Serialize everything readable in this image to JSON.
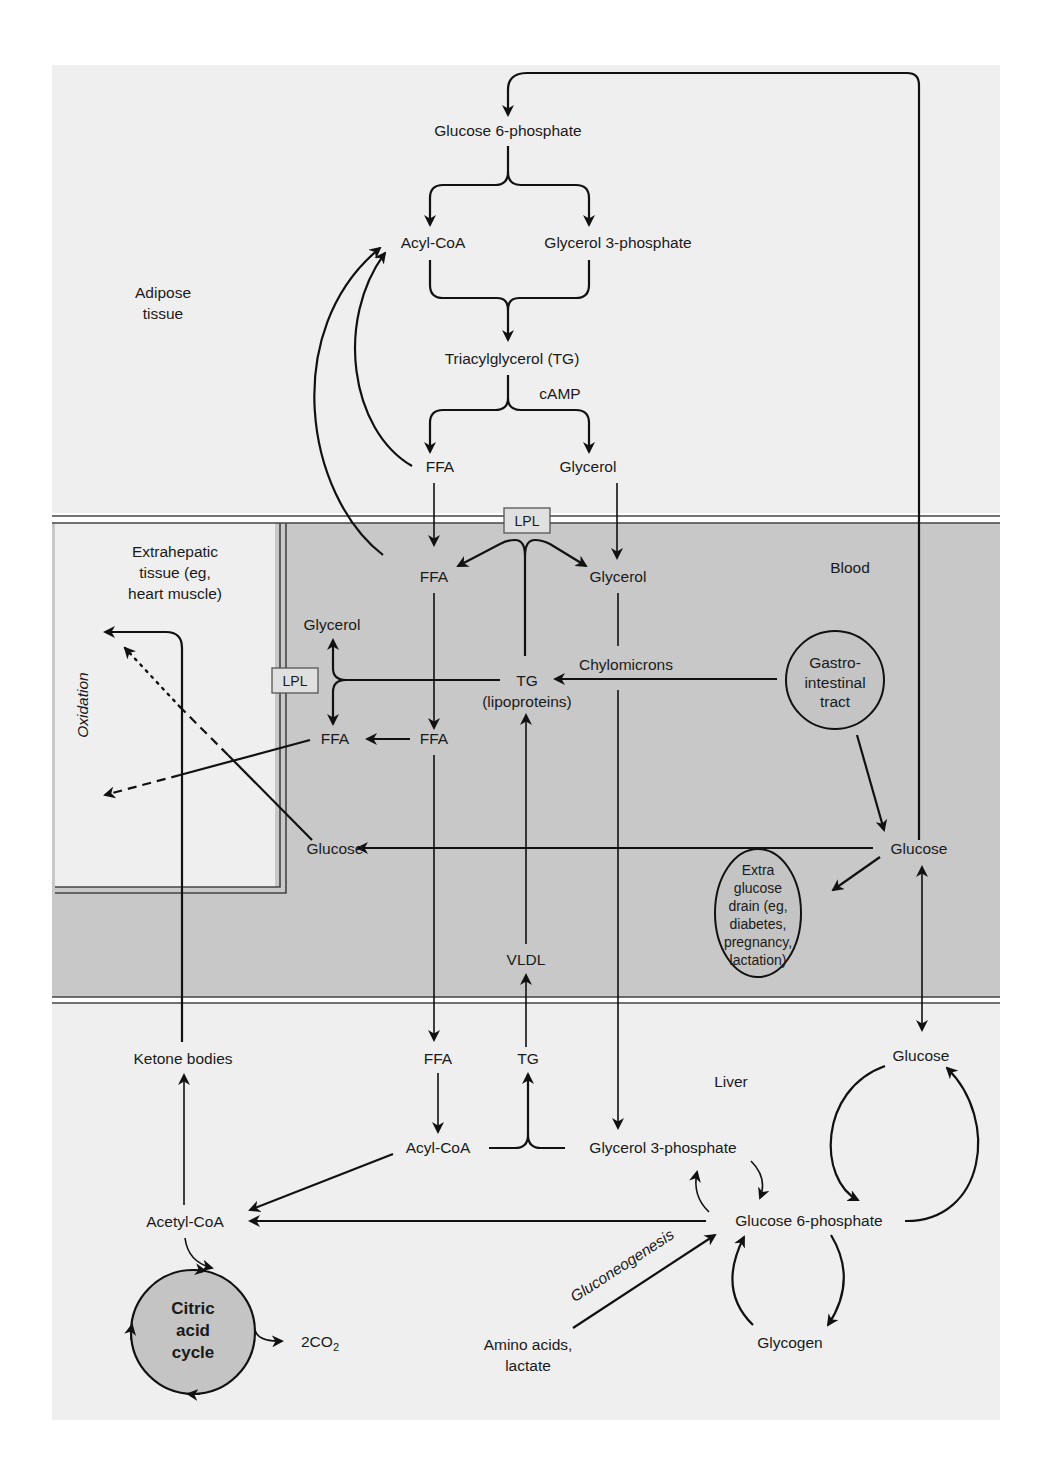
{
  "colors": {
    "page_bg": "#ffffff",
    "tissue_bg": "#efefef",
    "blood_bg": "#c8c8c8",
    "node_circle_fill": "#c4c4c4",
    "line": "#111111"
  },
  "regions": {
    "adipose": "Adipose tissue",
    "adipose_line1": "Adipose",
    "adipose_line2": "tissue",
    "extrahepatic_line1": "Extrahepatic",
    "extrahepatic_line2": "tissue (eg,",
    "extrahepatic_line3": "heart muscle)",
    "blood": "Blood",
    "liver": "Liver"
  },
  "adipose_nodes": {
    "glucose6p": "Glucose 6-phosphate",
    "acylcoa": "Acyl-CoA",
    "glycerol3p": "Glycerol 3-phosphate",
    "tg": "Triacylglycerol (TG)",
    "camp": "cAMP",
    "ffa": "FFA",
    "glycerol": "Glycerol"
  },
  "blood_nodes": {
    "lpl_top": "LPL",
    "ffa": "FFA",
    "glycerol": "Glycerol",
    "tg": "TG",
    "tg_sub": "(lipoproteins)",
    "chylomicrons": "Chylomicrons",
    "ffa2": "FFA",
    "vldl": "VLDL",
    "glucose": "Glucose",
    "gi_line1": "Gastro-",
    "gi_line2": "intestinal",
    "gi_line3": "tract",
    "drain_line1": "Extra",
    "drain_line2": "glucose",
    "drain_line3": "drain (eg,",
    "drain_line4": "diabetes,",
    "drain_line5": "pregnancy,",
    "drain_line6": "lactation)"
  },
  "extrahepatic_nodes": {
    "glycerol": "Glycerol",
    "lpl": "LPL",
    "ffa": "FFA",
    "glucose": "Glucose",
    "oxidation": "Oxidation"
  },
  "liver_nodes": {
    "ketone_bodies": "Ketone bodies",
    "ffa": "FFA",
    "tg": "TG",
    "glucose": "Glucose",
    "acylcoa": "Acyl-CoA",
    "glycerol3p": "Glycerol 3-phosphate",
    "acetylcoa": "Acetyl-CoA",
    "glucose6p": "Glucose 6-phosphate",
    "citric_line1": "Citric",
    "citric_line2": "acid",
    "citric_line3": "cycle",
    "co2": "2CO",
    "co2_sub": "2",
    "gluconeogenesis": "Gluconeogenesis",
    "amino_line1": "Amino acids,",
    "amino_line2": "lactate",
    "glycogen": "Glycogen"
  }
}
